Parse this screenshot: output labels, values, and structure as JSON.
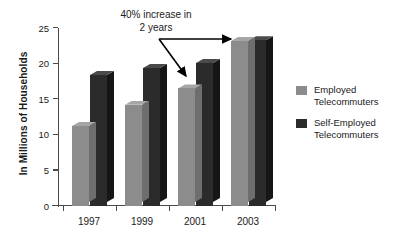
{
  "chart_data": {
    "type": "bar",
    "title": "",
    "xlabel": "",
    "ylabel": "In Millions of Households",
    "categories": [
      "1997",
      "1999",
      "2001",
      "2003"
    ],
    "ylim": [
      0,
      25
    ],
    "yticks": [
      0,
      5,
      10,
      15,
      20,
      25
    ],
    "ytick_labels": [
      "0",
      "5",
      "10",
      "15",
      "20",
      "25"
    ],
    "grid": false,
    "legend_position": "right",
    "series": [
      {
        "name": "Employed Telecommuters",
        "color": "#8c8c8c",
        "values": [
          11.3,
          14.3,
          16.6,
          23.3
        ]
      },
      {
        "name": "Self-Employed Telecommuters",
        "color": "#2b2b2b",
        "values": [
          18.5,
          19.5,
          20.2,
          23.4
        ]
      }
    ],
    "annotations": [
      {
        "text_line_1": "40% increase in",
        "text_line_2": "2 years",
        "targets": [
          "2001 Employed Telecommuters",
          "2003 Employed Telecommuters"
        ]
      }
    ]
  },
  "axis": {
    "y_title": "In Millions of Households",
    "y_ticks": [
      "25",
      "20",
      "15",
      "10",
      "5",
      "0"
    ],
    "x_labels": [
      "1997",
      "1999",
      "2001",
      "2003"
    ]
  },
  "annotation": {
    "line1": "40% increase in",
    "line2": "2 years"
  },
  "legend": {
    "items": [
      {
        "label_line_1": "Employed",
        "label_line_2": "Telecommuters",
        "color": "#8c8c8c"
      },
      {
        "label_line_1": "Self-Employed",
        "label_line_2": "Telecommuters",
        "color": "#2b2b2b"
      }
    ]
  }
}
